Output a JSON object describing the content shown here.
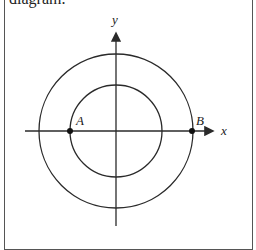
{
  "caption": {
    "text": "diagram."
  },
  "diagram": {
    "axes": {
      "x_label": "x",
      "y_label": "y"
    },
    "center": [
      116,
      131
    ],
    "circles": [
      {
        "name": "outer-circle",
        "radius": 77
      },
      {
        "name": "inner-circle",
        "radius": 46
      }
    ],
    "points": [
      {
        "label": "A",
        "x": 70,
        "y": 131
      },
      {
        "label": "B",
        "x": 192,
        "y": 131
      }
    ],
    "stroke_color": "#2a2a2a"
  }
}
